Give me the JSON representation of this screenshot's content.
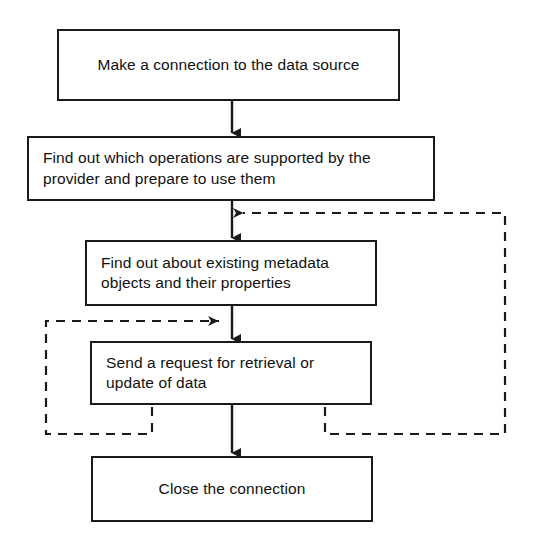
{
  "diagram": {
    "background_color": "#ffffff",
    "line_color": "#1a1a1a",
    "nodes": [
      {
        "id": "make-connection",
        "label": "Make a connection to the data source",
        "align": "center",
        "x": 57,
        "y": 29,
        "w": 343,
        "h": 72
      },
      {
        "id": "find-operations",
        "label": "Find out which operations are supported by the\nprovider and prepare to use them",
        "align": "left",
        "x": 27,
        "y": 136,
        "w": 408,
        "h": 65
      },
      {
        "id": "find-metadata",
        "label": "Find out about existing metadata\nobjects and their properties",
        "align": "left",
        "x": 85,
        "y": 240,
        "w": 292,
        "h": 66
      },
      {
        "id": "send-request",
        "label": "Send a request for retrieval or\nupdate of data",
        "align": "left",
        "x": 90,
        "y": 341,
        "w": 282,
        "h": 64
      },
      {
        "id": "close-connection",
        "label": "Close the connection",
        "align": "center",
        "x": 91,
        "y": 456,
        "w": 282,
        "h": 66
      }
    ],
    "solid_connectors": [
      {
        "id": "arrow-make-to-find-operations",
        "from": "make-connection",
        "to": "find-operations"
      },
      {
        "id": "arrow-find-operations-to-metadata",
        "from": "find-operations",
        "to": "find-metadata"
      },
      {
        "id": "arrow-metadata-to-send-request",
        "from": "find-metadata",
        "to": "send-request"
      },
      {
        "id": "arrow-send-request-to-close",
        "from": "send-request",
        "to": "close-connection"
      }
    ],
    "dashed_loops": [
      {
        "id": "outer-feedback-loop",
        "description": "Loop from below Send a request back up to the Find out about existing metadata entry point",
        "style": "dashed",
        "direction": "right-then-up-then-left-with-arrow"
      },
      {
        "id": "inner-feedback-loop",
        "description": "Loop from below Send a request back to the Send a request entry point",
        "style": "dashed",
        "direction": "left-then-up-then-right-with-arrow"
      }
    ]
  }
}
